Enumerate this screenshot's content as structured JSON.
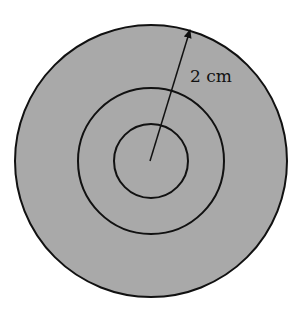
{
  "diagram": {
    "type": "concentric-circles",
    "circles": [
      {
        "name": "outer",
        "cx": 151,
        "cy": 161,
        "r": 136,
        "fill": "#a9a9a9"
      },
      {
        "name": "middle",
        "cx": 151,
        "cy": 161,
        "r": 73,
        "fill": "none"
      },
      {
        "name": "inner",
        "cx": 151,
        "cy": 161,
        "r": 37,
        "fill": "none"
      }
    ],
    "radius_arrow": {
      "from": [
        150,
        161
      ],
      "to": [
        190,
        29
      ]
    },
    "label": "2 cm",
    "colors": {
      "fill": "#a9a9a9",
      "stroke": "#111111",
      "background": "#ffffff"
    }
  }
}
